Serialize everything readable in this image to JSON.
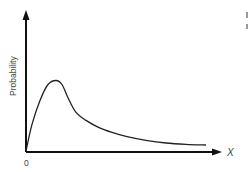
{
  "chart_data": {
    "type": "line",
    "title": "",
    "xlabel": "X",
    "ylabel": "Probability",
    "x_tick_labels": [
      "0"
    ],
    "xlim": [
      0,
      10
    ],
    "ylim": [
      0,
      1
    ],
    "grid": false,
    "legend": "none",
    "series": [
      {
        "name": "probability-distribution",
        "x": [
          0,
          0.3,
          0.7,
          1.1,
          1.5,
          1.8,
          2.1,
          2.5,
          3.0,
          3.6,
          4.3,
          5.0,
          6.0,
          7.0,
          8.0,
          9.0
        ],
        "y": [
          0.0,
          0.2,
          0.38,
          0.5,
          0.53,
          0.5,
          0.4,
          0.29,
          0.23,
          0.18,
          0.14,
          0.11,
          0.08,
          0.06,
          0.05,
          0.045
        ]
      }
    ]
  }
}
